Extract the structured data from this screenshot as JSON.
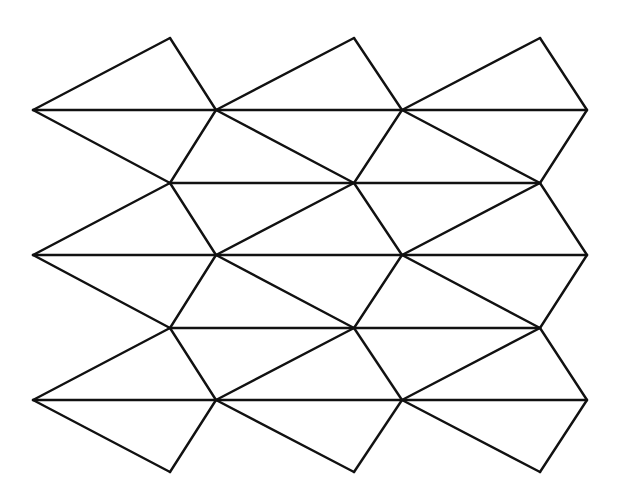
{
  "diagram": {
    "type": "tessellation",
    "stroke_color": "#111111",
    "background_color": "#ffffff",
    "vertex_rows": {
      "main_rows_y": [
        110,
        255,
        400
      ],
      "main_rows_x": [
        33,
        216,
        402,
        587
      ],
      "offset_rows_y": [
        183,
        328
      ],
      "offset_rows_x": [
        170,
        354,
        540
      ],
      "top_apex_y": 38,
      "bottom_apex_y": 472,
      "apex_x": [
        170,
        354,
        540
      ]
    }
  }
}
